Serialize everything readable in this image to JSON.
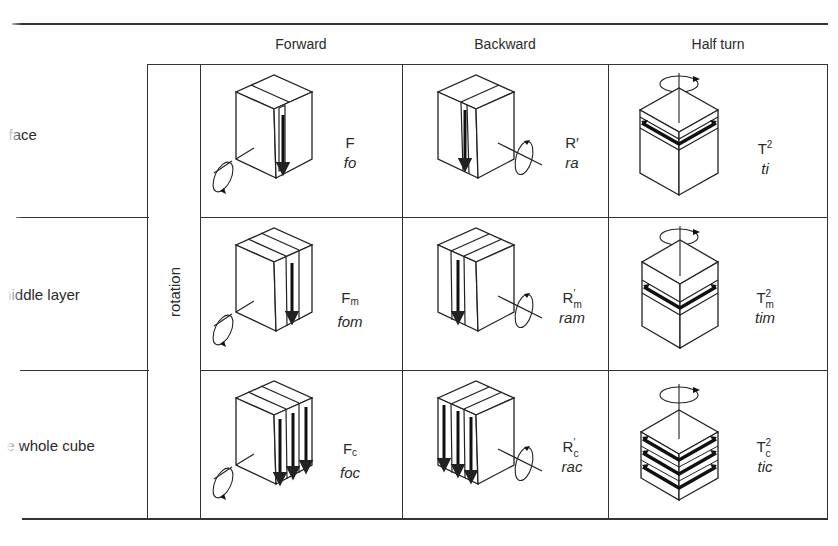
{
  "column_headers": [
    "Forward",
    "Backward",
    "Half turn"
  ],
  "row_labels": [
    "a face",
    "a middle layer",
    "the whole cube"
  ],
  "row_labels_visible": [
    "a face",
    "middle layer",
    "he whole cube"
  ],
  "group_label": "rotation",
  "cells": [
    [
      {
        "symbol": "F",
        "subscript": "",
        "superscript": "",
        "word": "fo",
        "diagram": "cube-face-forward"
      },
      {
        "symbol": "R",
        "subscript": "",
        "superscript": "′",
        "word": "ra",
        "diagram": "cube-face-backward"
      },
      {
        "symbol": "T",
        "subscript": "",
        "superscript": "2",
        "word": "ti",
        "diagram": "cube-face-halfturn"
      }
    ],
    [
      {
        "symbol": "F",
        "subscript": "m",
        "superscript": "",
        "word": "fom",
        "diagram": "cube-middle-forward"
      },
      {
        "symbol": "R",
        "subscript": "m",
        "superscript": "′",
        "word": "ram",
        "diagram": "cube-middle-backward"
      },
      {
        "symbol": "T",
        "subscript": "m",
        "superscript": "2",
        "word": "tim",
        "diagram": "cube-middle-halfturn"
      }
    ],
    [
      {
        "symbol": "F",
        "subscript": "c",
        "superscript": "",
        "word": "foc",
        "diagram": "cube-whole-forward"
      },
      {
        "symbol": "R",
        "subscript": "c",
        "superscript": "′",
        "word": "rac",
        "diagram": "cube-whole-backward"
      },
      {
        "symbol": "T",
        "subscript": "c",
        "superscript": "2",
        "word": "tic",
        "diagram": "cube-whole-halfturn"
      }
    ]
  ],
  "colors": {
    "ink": "#2a2a2a",
    "paper": "#ffffff"
  }
}
